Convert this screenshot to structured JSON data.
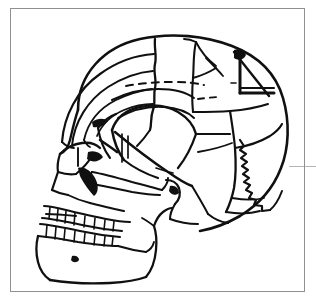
{
  "figure": {
    "kind": "line-drawing",
    "caption": "",
    "background_color": "#ffffff",
    "ink_color": "#101010",
    "frame_color": "#909090",
    "bleed_color": "#b4b4b4",
    "canvas": {
      "width": 316,
      "height": 303
    }
  },
  "frame": {
    "name": "figure-border",
    "x": 10,
    "y": 8,
    "width": 295,
    "height": 284,
    "stroke_width": 1
  },
  "bleed_mark": {
    "name": "stray-horizontal-rule",
    "x1": 289,
    "x2": 316,
    "y": 166
  },
  "regions": [
    {
      "id": "frontal-bone",
      "label": "Frontal bone"
    },
    {
      "id": "parietal-bone",
      "label": "Parietal bone"
    },
    {
      "id": "occipital-bone",
      "label": "Occipital bone"
    },
    {
      "id": "temporal-bone",
      "label": "Temporal bone"
    },
    {
      "id": "sphenoid-greater-wing",
      "label": "Sphenoid, greater wing"
    },
    {
      "id": "zygomatic-arch",
      "label": "Zygomatic arch"
    },
    {
      "id": "maxilla",
      "label": "Maxilla"
    },
    {
      "id": "mandible",
      "label": "Mandible"
    },
    {
      "id": "nasal-aperture",
      "label": "Nasal aperture"
    },
    {
      "id": "orbit",
      "label": "Orbit"
    },
    {
      "id": "mastoid-process",
      "label": "Mastoid process"
    },
    {
      "id": "coronal-suture",
      "label": "Coronal suture"
    },
    {
      "id": "lambdoid-suture",
      "label": "Lambdoid suture"
    },
    {
      "id": "squamosal-suture",
      "label": "Squamosal suture"
    },
    {
      "id": "rectangular-defect",
      "label": "Rectangular bone defect"
    },
    {
      "id": "hidden-outline",
      "label": "Hidden outline (dashed)"
    },
    {
      "id": "upper-dentition",
      "label": "Upper dentition"
    },
    {
      "id": "lower-dentition",
      "label": "Lower dentition"
    },
    {
      "id": "mental-foramen",
      "label": "Mental foramen"
    }
  ],
  "teeth": {
    "upper_count": 8,
    "lower_count": 8
  },
  "annotations": []
}
